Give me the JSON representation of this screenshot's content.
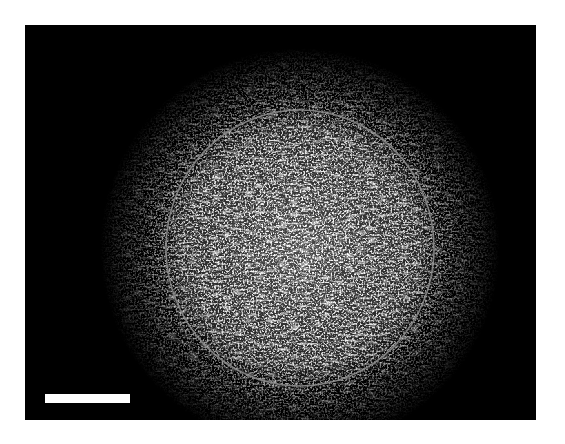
{
  "figure": {
    "type": "fluorescence micrograph",
    "background_color": "#000000",
    "frame_color": "#ffffff",
    "signal_color": "#d8d8d8",
    "region_of_interest": {
      "shape": "ellipse",
      "center_x": 300,
      "center_y": 248,
      "radius_x": 134,
      "radius_y": 138,
      "stroke_color": "#8a8a8a"
    },
    "scale_bar": {
      "color": "#ffffff",
      "label": ""
    }
  }
}
